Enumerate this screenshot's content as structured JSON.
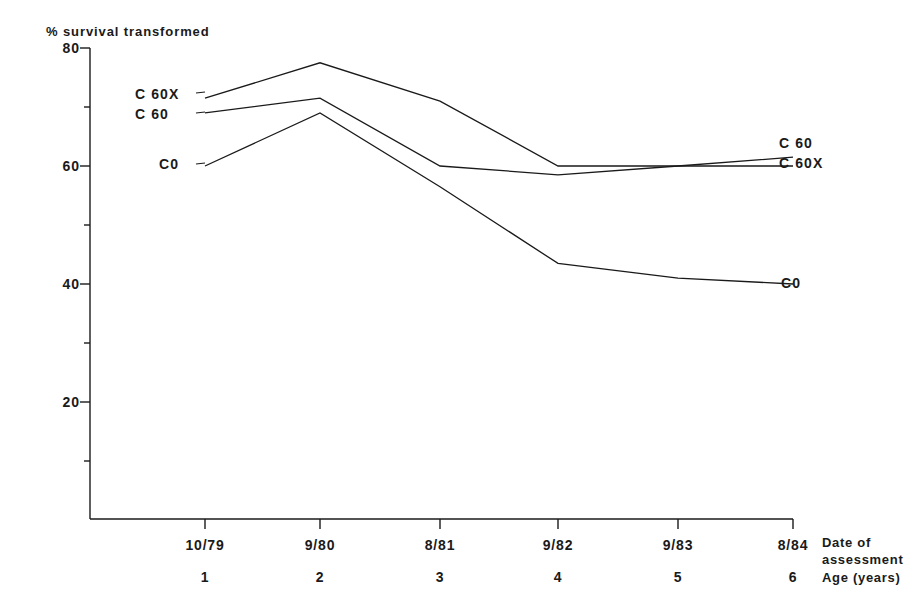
{
  "chart_data": {
    "type": "line",
    "title": "% survival transformed",
    "xlabel_primary": "Date of assessment",
    "xlabel_secondary": "Age (years)",
    "ylabel": "% survival transformed",
    "categories": [
      "10/79",
      "9/80",
      "8/81",
      "9/82",
      "9/83",
      "8/84"
    ],
    "age_categories": [
      "1",
      "2",
      "3",
      "4",
      "5",
      "6"
    ],
    "ylim": [
      0,
      80
    ],
    "yticks_major": [
      "80",
      "60",
      "40",
      "20"
    ],
    "yticks_major_values": [
      80,
      60,
      40,
      20
    ],
    "yticks_minor_values": [
      70,
      50,
      30,
      10
    ],
    "grid": false,
    "legend_position": "inline-line-ends",
    "series": [
      {
        "name": "C 60X",
        "label_left": "C 60X",
        "label_right": "C 60X",
        "values": [
          71.5,
          77.5,
          71.0,
          60.0,
          60.0,
          60.0
        ]
      },
      {
        "name": "C 60",
        "label_left": "C 60",
        "label_right": "C 60",
        "values": [
          69.0,
          71.5,
          60.0,
          58.5,
          60.0,
          61.5
        ]
      },
      {
        "name": "C0",
        "label_left": "C0",
        "label_right": "C0",
        "values": [
          60.0,
          69.0,
          56.5,
          43.5,
          41.0,
          40.0
        ]
      }
    ],
    "colors": {
      "line": "#1a1a1a",
      "axis": "#1a1a1a",
      "background": "#ffffff"
    }
  },
  "labels": {
    "ytitle": "% survival transformed",
    "ytick_80": "80",
    "ytick_60": "60",
    "ytick_40": "40",
    "ytick_20": "20",
    "xtick_1": "10/79",
    "xtick_2": "9/80",
    "xtick_3": "8/81",
    "xtick_4": "9/82",
    "xtick_5": "9/83",
    "xtick_6": "8/84",
    "age_1": "1",
    "age_2": "2",
    "age_3": "3",
    "age_4": "4",
    "age_5": "5",
    "age_6": "6",
    "caption_date_line1": "Date of",
    "caption_date_line2": "assessment",
    "caption_age": "Age (years)",
    "left_c60x": "C 60X",
    "left_c60": "C 60",
    "left_c0": "C0",
    "right_c60": "C 60",
    "right_c60x": "C 60X",
    "right_c0": "C0"
  }
}
